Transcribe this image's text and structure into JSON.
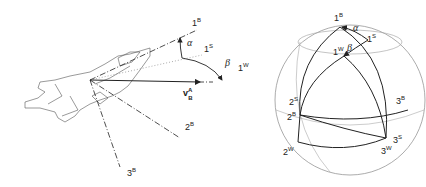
{
  "left_figure": {
    "title": "aircraft body, stability and wind axes",
    "labels": {
      "axis_1B": {
        "base": "1",
        "sup": "B"
      },
      "axis_1S": {
        "base": "1",
        "sup": "S"
      },
      "axis_1W": {
        "base": "1",
        "sup": "W"
      },
      "axis_2B": {
        "base": "2",
        "sup": "B"
      },
      "axis_3B": {
        "base": "3",
        "sup": "B"
      },
      "alpha": "α",
      "beta": "β",
      "velocity": {
        "base": "v",
        "sup": "A",
        "sub": "B"
      }
    }
  },
  "right_figure": {
    "title": "unit sphere showing axis frames",
    "labels": {
      "p_1B": {
        "base": "1",
        "sup": "B"
      },
      "p_1S": {
        "base": "1",
        "sup": "S"
      },
      "p_1W": {
        "base": "1",
        "sup": "W"
      },
      "p_2S": {
        "base": "2",
        "sup": "S"
      },
      "p_2B": {
        "base": "2",
        "sup": "B"
      },
      "p_2W": {
        "base": "2",
        "sup": "W"
      },
      "p_3B": {
        "base": "3",
        "sup": "B"
      },
      "p_3S": {
        "base": "3",
        "sup": "S"
      },
      "p_3W": {
        "base": "3",
        "sup": "W"
      },
      "alpha": "α",
      "beta": "β"
    }
  },
  "colors": {
    "line": "#222222",
    "light": "#9a9a9a",
    "background": "#ffffff"
  }
}
